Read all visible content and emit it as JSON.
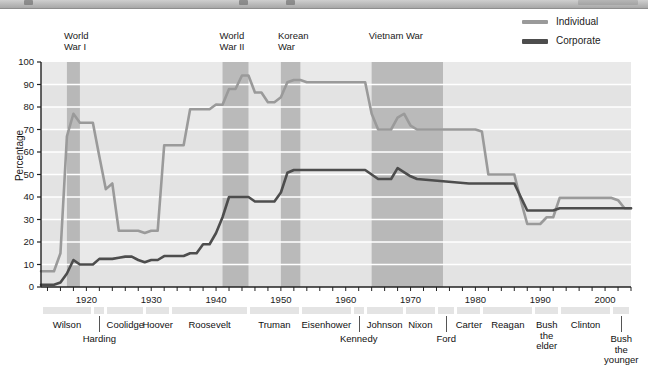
{
  "window": {
    "chrome_visible": true
  },
  "legend": {
    "position": "top-right",
    "items": [
      {
        "label": "Individual",
        "color": "#9a9a9a",
        "name": "individual"
      },
      {
        "label": "Corporate",
        "color": "#4d4d4d",
        "name": "corporate"
      }
    ]
  },
  "chart_data": {
    "type": "line",
    "title": "",
    "subtitle": "",
    "xlabel": "",
    "ylabel": "Percentage",
    "xlim": [
      1913,
      2004
    ],
    "ylim": [
      0,
      100
    ],
    "grid": true,
    "legend_position": "top-right",
    "y_ticks": [
      0,
      10,
      20,
      30,
      40,
      50,
      60,
      70,
      80,
      90,
      100
    ],
    "x_tick_labels": [
      1920,
      1930,
      1940,
      1950,
      1960,
      1970,
      1980,
      1990,
      2000
    ],
    "x_tick_step_minor": 2,
    "series": [
      {
        "name": "Individual",
        "color": "#9a9a9a",
        "x": [
          1913,
          1914,
          1915,
          1916,
          1917,
          1918,
          1919,
          1920,
          1921,
          1922,
          1923,
          1924,
          1925,
          1926,
          1927,
          1928,
          1929,
          1930,
          1931,
          1932,
          1933,
          1934,
          1935,
          1936,
          1937,
          1938,
          1939,
          1940,
          1941,
          1942,
          1943,
          1944,
          1945,
          1946,
          1947,
          1948,
          1949,
          1950,
          1951,
          1952,
          1953,
          1954,
          1955,
          1963,
          1964,
          1965,
          1966,
          1967,
          1968,
          1969,
          1970,
          1971,
          1980,
          1981,
          1982,
          1986,
          1987,
          1988,
          1990,
          1991,
          1992,
          1993,
          2001,
          2002,
          2003,
          2004
        ],
        "y": [
          7,
          7,
          7,
          15,
          67,
          77,
          73,
          73,
          73,
          58,
          43.5,
          46,
          25,
          25,
          25,
          25,
          24,
          25,
          25,
          63,
          63,
          63,
          63,
          79,
          79,
          79,
          79,
          81.1,
          81,
          88,
          88,
          94,
          94,
          86.45,
          86.45,
          82.13,
          82.13,
          84.36,
          91,
          92,
          92,
          91,
          91,
          91,
          77,
          70,
          70,
          70,
          75.25,
          77,
          71.75,
          70,
          70,
          69.125,
          50,
          50,
          38.5,
          28,
          28,
          31,
          31,
          39.6,
          39.6,
          38.6,
          35,
          35
        ]
      },
      {
        "name": "Corporate",
        "color": "#4d4d4d",
        "x": [
          1913,
          1914,
          1915,
          1916,
          1917,
          1918,
          1919,
          1920,
          1921,
          1922,
          1923,
          1924,
          1925,
          1926,
          1927,
          1928,
          1929,
          1930,
          1931,
          1932,
          1933,
          1934,
          1935,
          1936,
          1937,
          1938,
          1939,
          1940,
          1941,
          1942,
          1943,
          1945,
          1946,
          1949,
          1950,
          1951,
          1952,
          1963,
          1964,
          1965,
          1967,
          1968,
          1970,
          1971,
          1979,
          1980,
          1982,
          1986,
          1987,
          1988,
          1990,
          1992,
          1993,
          2001,
          2004
        ],
        "y": [
          1,
          1,
          1,
          2,
          6,
          12,
          10,
          10,
          10,
          12.5,
          12.5,
          12.5,
          13,
          13.5,
          13.5,
          12,
          11,
          12,
          12,
          13.75,
          13.75,
          13.75,
          13.75,
          15,
          15,
          19,
          19,
          24,
          31,
          40,
          40,
          40,
          38,
          38,
          42,
          50.75,
          52,
          52,
          50,
          48,
          48,
          52.8,
          49.2,
          48,
          46,
          46,
          46,
          46,
          40,
          34,
          34,
          34,
          35,
          35,
          35
        ]
      }
    ],
    "annotations": {
      "war_bands": [
        {
          "label": "World\nWar I",
          "start": 1917,
          "end": 1919,
          "color": "#a9a9a9"
        },
        {
          "label": "World\nWar II",
          "start": 1941,
          "end": 1945,
          "color": "#a9a9a9"
        },
        {
          "label": "Korean\nWar",
          "start": 1950,
          "end": 1953,
          "color": "#a9a9a9"
        },
        {
          "label": "Vietnam War",
          "start": 1964,
          "end": 1975,
          "color": "#a9a9a9"
        }
      ]
    }
  },
  "presidents": [
    {
      "name": "Wilson",
      "start": 1913,
      "end": 1921,
      "row": 0
    },
    {
      "name": "Harding",
      "start": 1921,
      "end": 1923,
      "row": 1
    },
    {
      "name": "Coolidge",
      "start": 1923,
      "end": 1929,
      "row": 0
    },
    {
      "name": "Hoover",
      "start": 1929,
      "end": 1933,
      "row": 0
    },
    {
      "name": "Roosevelt",
      "start": 1933,
      "end": 1945,
      "row": 0
    },
    {
      "name": "Truman",
      "start": 1945,
      "end": 1953,
      "row": 0
    },
    {
      "name": "Eisenhower",
      "start": 1953,
      "end": 1961,
      "row": 0
    },
    {
      "name": "Kennedy",
      "start": 1961,
      "end": 1963,
      "row": 1
    },
    {
      "name": "Johnson",
      "start": 1963,
      "end": 1969,
      "row": 0
    },
    {
      "name": "Nixon",
      "start": 1969,
      "end": 1974,
      "row": 0
    },
    {
      "name": "Ford",
      "start": 1974,
      "end": 1977,
      "row": 1
    },
    {
      "name": "Carter",
      "start": 1977,
      "end": 1981,
      "row": 0
    },
    {
      "name": "Reagan",
      "start": 1981,
      "end": 1989,
      "row": 0
    },
    {
      "name": "Bush\nthe\nelder",
      "start": 1989,
      "end": 1993,
      "row": 0
    },
    {
      "name": "Clinton",
      "start": 1993,
      "end": 2001,
      "row": 0
    },
    {
      "name": "Bush\nthe\nyounger",
      "start": 2001,
      "end": 2004,
      "row": 1
    }
  ]
}
